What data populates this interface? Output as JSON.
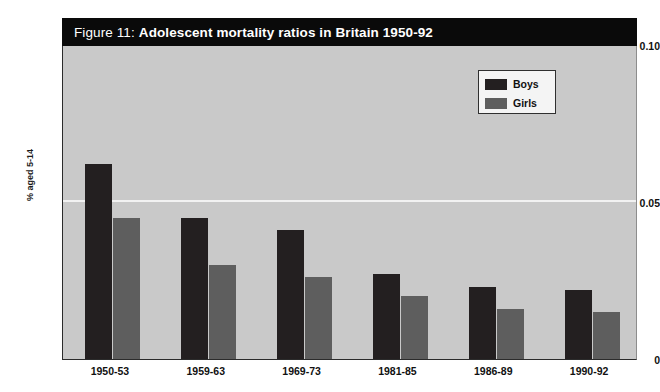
{
  "figure": {
    "title_prefix": "Figure 11:",
    "title_main": "Adolescent mortality ratios in Britain 1950-92"
  },
  "legend": {
    "position": "top-right",
    "entries": [
      {
        "label": "Boys",
        "color": "#231f20"
      },
      {
        "label": "Girls",
        "color": "#5e5e5e"
      }
    ]
  },
  "axes": {
    "y_title": "% aged 5-14",
    "y_ticks": [
      "0.10",
      "0.05",
      "0"
    ],
    "x_ticks": [
      "1950-53",
      "1959-63",
      "1969-73",
      "1981-85",
      "1986-89",
      "1990-92"
    ]
  },
  "colors": {
    "plot_background": "#c9c9c9",
    "banner_background": "#0a0a0a",
    "gridline": "#f2f2f2",
    "boys": "#231f20",
    "girls": "#5e5e5e"
  },
  "chart_data": {
    "type": "bar",
    "title": "Figure 11: Adolescent mortality ratios in Britain 1950-92",
    "xlabel": "",
    "ylabel": "% aged 5-14",
    "ylim": [
      0,
      0.1
    ],
    "yticks": [
      0,
      0.05,
      0.1
    ],
    "grid": true,
    "legend_position": "top-right",
    "categories": [
      "1950-53",
      "1959-63",
      "1969-73",
      "1981-85",
      "1986-89",
      "1990-92"
    ],
    "series": [
      {
        "name": "Boys",
        "color": "#231f20",
        "values": [
          0.062,
          0.045,
          0.041,
          0.027,
          0.023,
          0.022
        ]
      },
      {
        "name": "Girls",
        "color": "#5e5e5e",
        "values": [
          0.045,
          0.03,
          0.026,
          0.02,
          0.016,
          0.015
        ]
      }
    ]
  }
}
